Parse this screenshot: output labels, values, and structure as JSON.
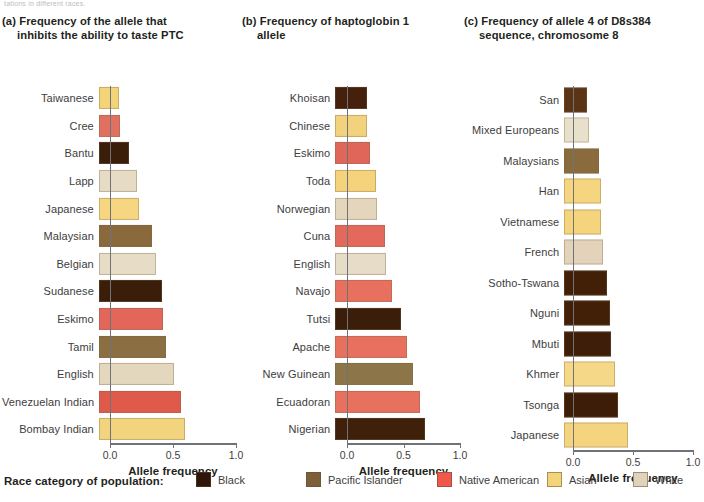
{
  "top_clipped_caption": "tations in different races.",
  "legend": {
    "title": "Race category of population:",
    "items": [
      {
        "label": "Black",
        "color": "#2e1708",
        "key": "black"
      },
      {
        "label": "Pacific Islander",
        "color": "#7d6038",
        "key": "pacific-islander"
      },
      {
        "label": "Native American",
        "color": "#f1584b",
        "key": "native-american"
      },
      {
        "label": "Asian",
        "color": "#f4d479",
        "key": "asian"
      },
      {
        "label": "White",
        "color": "#e0d3bb",
        "key": "white"
      }
    ]
  },
  "axis": {
    "title": "Allele frequency",
    "ticks": [
      "0.0",
      "0.5",
      "1.0"
    ],
    "tick_values": [
      0.0,
      0.5,
      1.0
    ],
    "xlim": [
      0.0,
      1.0
    ]
  },
  "panels": [
    {
      "id": "a",
      "tag": "(a)",
      "title_line1": "Frequency of the allele that",
      "title_line2": "inhibits the ability to taste PTC"
    },
    {
      "id": "b",
      "tag": "(b)",
      "title_line1": "Frequency of haptoglobin 1",
      "title_line2": "allele"
    },
    {
      "id": "c",
      "tag": "(c)",
      "title_line1": "Frequency of allele 4 of D8s384",
      "title_line2": "sequence, chromosome 8"
    }
  ],
  "chart_data": [
    {
      "type": "bar",
      "panel": "a",
      "orientation": "horizontal",
      "title": "(a) Frequency of the allele that inhibits the ability to taste PTC",
      "xlabel": "Allele frequency",
      "ylabel": "",
      "xlim": [
        0.0,
        1.0
      ],
      "xticks": [
        0.0,
        0.5,
        1.0
      ],
      "grid": false,
      "legend_position": "bottom",
      "categories": [
        "Taiwanese",
        "Cree",
        "Bantu",
        "Lapp",
        "Japanese",
        "Malaysian",
        "Belgian",
        "Sudanese",
        "Eskimo",
        "Tamil",
        "English",
        "Venezuelan Indian",
        "Bombay Indian"
      ],
      "values": [
        0.16,
        0.17,
        0.24,
        0.3,
        0.32,
        0.42,
        0.45,
        0.5,
        0.51,
        0.53,
        0.6,
        0.65,
        0.68
      ],
      "race_categories": [
        "asian",
        "native-american",
        "black",
        "white",
        "asian",
        "pacific-islander",
        "white",
        "black",
        "native-american",
        "pacific-islander",
        "white",
        "native-american",
        "asian"
      ],
      "colors": [
        "#f4d479",
        "#e0705f",
        "#3a1e0a",
        "#e6dcc6",
        "#f6d681",
        "#8a6a3c",
        "#e7ddc7",
        "#3a1e0a",
        "#e2665a",
        "#8b6e42",
        "#e3d7bd",
        "#e05a4c",
        "#f3d47e"
      ]
    },
    {
      "type": "bar",
      "panel": "b",
      "orientation": "horizontal",
      "title": "(b) Frequency of haptoglobin 1 allele",
      "xlabel": "Allele frequency",
      "ylabel": "",
      "xlim": [
        0.0,
        1.0
      ],
      "xticks": [
        0.0,
        0.5,
        1.0
      ],
      "grid": false,
      "legend_position": "bottom",
      "categories": [
        "Khoisan",
        "Chinese",
        "Eskimo",
        "Toda",
        "Norwegian",
        "Cuna",
        "English",
        "Navajo",
        "Tutsi",
        "Apache",
        "New Guinean",
        "Ecuadoran",
        "Nigerian"
      ],
      "values": [
        0.28,
        0.28,
        0.31,
        0.36,
        0.37,
        0.44,
        0.45,
        0.5,
        0.58,
        0.63,
        0.69,
        0.75,
        0.79
      ],
      "race_categories": [
        "black",
        "asian",
        "native-american",
        "asian",
        "white",
        "native-american",
        "white",
        "native-american",
        "black",
        "native-american",
        "pacific-islander",
        "native-american",
        "black"
      ],
      "colors": [
        "#45200c",
        "#f2d27d",
        "#e0665a",
        "#f5d27c",
        "#e3d6bd",
        "#e2695c",
        "#e6dcc8",
        "#e8705f",
        "#3a1e0a",
        "#e8705f",
        "#8b7549",
        "#e8705f",
        "#3e200b"
      ]
    },
    {
      "type": "bar",
      "panel": "c",
      "orientation": "horizontal",
      "title": "(c) Frequency of allele 4 of D8s384 sequence, chromosome 8",
      "xlabel": "Allele frequency",
      "ylabel": "",
      "xlim": [
        0.0,
        1.0
      ],
      "xticks": [
        0.0,
        0.5,
        1.0
      ],
      "grid": false,
      "legend_position": "bottom",
      "categories": [
        "San",
        "Mixed Europeans",
        "Malaysians",
        "Han",
        "Vietnamese",
        "French",
        "Sotho-Tswana",
        "Nguni",
        "Mbuti",
        "Khmer",
        "Tsonga",
        "Japanese"
      ],
      "values": [
        0.19,
        0.21,
        0.29,
        0.31,
        0.31,
        0.32,
        0.36,
        0.38,
        0.39,
        0.42,
        0.45,
        0.53
      ],
      "race_categories": [
        "black",
        "white",
        "pacific-islander",
        "asian",
        "asian",
        "white",
        "black",
        "black",
        "black",
        "asian",
        "black",
        "asian"
      ],
      "colors": [
        "#5a3414",
        "#e9e0cb",
        "#8a6b3d",
        "#f5d57f",
        "#f4d47c",
        "#e2d3ba",
        "#422008",
        "#422008",
        "#3e1e08",
        "#f6d889",
        "#3d1d07",
        "#f5d47f"
      ]
    }
  ]
}
